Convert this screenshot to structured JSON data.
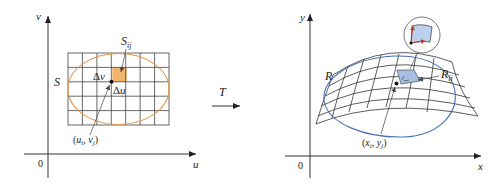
{
  "figure": {
    "left_panel": {
      "axis_vertical_label": "v",
      "axis_horizontal_label": "u",
      "origin_label": "0",
      "region_label": "S",
      "subrect_label": "S",
      "subrect_subscript": "ij",
      "delta_v_label": "Δv",
      "delta_u_label": "Δu",
      "point_label": "(u",
      "point_label_i": "i",
      "point_label_mid": ", v",
      "point_label_j": "j",
      "point_label_end": ")",
      "grid_columns": 7,
      "grid_rows": 5,
      "region_color": "#e09a4a",
      "subrect_fill": "#f2b46a"
    },
    "transform": {
      "label": "T"
    },
    "right_panel": {
      "axis_vertical_label": "y",
      "axis_horizontal_label": "x",
      "origin_label": "0",
      "region_label": "R",
      "subregion_label": "R",
      "subregion_subscript": "ij",
      "point_label": "(x",
      "point_label_i": "i",
      "point_label_mid": ", y",
      "point_label_j": "j",
      "point_label_end": ")",
      "region_color": "#4a6fb5",
      "subregion_fill": "#a9c0e6",
      "inset_fill": "#bcd0ee"
    }
  }
}
